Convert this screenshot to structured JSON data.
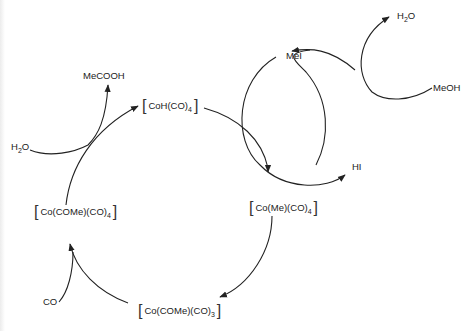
{
  "diagram": {
    "line_color": "#222222",
    "background": "#ffffff"
  },
  "species": {
    "coh_co4": {
      "bracket_open": "[",
      "main": "CoH(CO)",
      "sub": "4",
      "bracket_close": "]"
    },
    "co_me_co4": {
      "bracket_open": "[",
      "main": "Co(Me)(CO)",
      "sub": "4",
      "bracket_close": "]"
    },
    "co_come_co3": {
      "bracket_open": "[",
      "main": "Co(COMe)(CO)",
      "sub": "3",
      "bracket_close": "]"
    },
    "co_come_co4": {
      "bracket_open": "[",
      "main": "Co(COMe)(CO)",
      "sub": "4",
      "bracket_close": "]"
    }
  },
  "reagents": {
    "mecooh": "MeCOOH",
    "h2o_left_main": "H",
    "h2o_left_sub": "2",
    "h2o_left_end": "O",
    "co": "CO",
    "mei": "MeI",
    "hi": "HI",
    "meoh": "MeOH",
    "h2o_top_main": "H",
    "h2o_top_sub": "2",
    "h2o_top_end": "O"
  }
}
